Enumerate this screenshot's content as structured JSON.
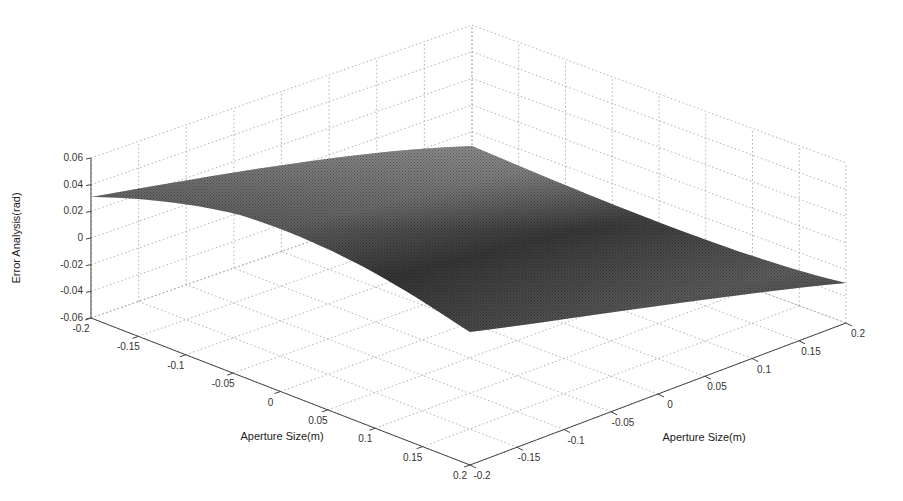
{
  "chart_data": {
    "type": "surface",
    "title": "",
    "xlabel": "Aperture Size(m)",
    "ylabel": "Aperture Size(m)",
    "zlabel": "Error Analysis(rad)",
    "x_ticks": [
      "-0.2",
      "-0.15",
      "-0.1",
      "-0.05",
      "0",
      "0.05",
      "0.1",
      "0.15",
      "0.2"
    ],
    "y_ticks": [
      "-0.2",
      "-0.15",
      "-0.1",
      "-0.05",
      "0",
      "0.05",
      "0.1",
      "0.15",
      "0.2"
    ],
    "z_ticks": [
      "-0.06",
      "-0.04",
      "-0.02",
      "0",
      "0.02",
      "0.04",
      "0.06"
    ],
    "xlim": [
      -0.2,
      0.2
    ],
    "ylim": [
      -0.2,
      0.2
    ],
    "zlim": [
      -0.06,
      0.06
    ],
    "grid": true,
    "colormap": "gray",
    "surface_corners": [
      {
        "x": -0.2,
        "y": -0.2,
        "z": 0.03
      },
      {
        "x": -0.2,
        "y": 0.2,
        "z": 0.0
      },
      {
        "x": 0.2,
        "y": 0.2,
        "z": -0.035
      },
      {
        "x": 0.2,
        "y": -0.2,
        "z": 0.0
      }
    ]
  }
}
